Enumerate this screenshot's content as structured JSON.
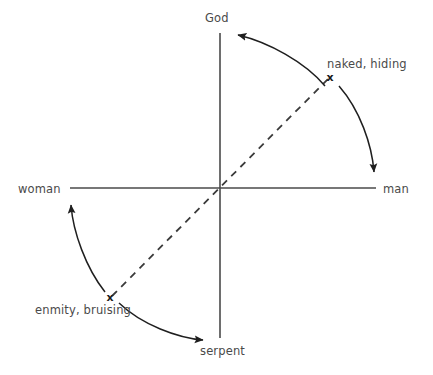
{
  "diagram": {
    "type": "relationship-axes-diagram",
    "axes": {
      "vertical": {
        "top_label": "God",
        "bottom_label": "serpent",
        "origin": {
          "x": 220,
          "y": 188
        },
        "top_y": 33,
        "bottom_y": 338
      },
      "horizontal": {
        "left_label": "woman",
        "right_label": "man",
        "left_x": 70,
        "right_x": 376
      }
    },
    "markers": [
      {
        "id": "marker-upper-right",
        "glyph": "x",
        "label": "naked, hiding",
        "x": 330,
        "y": 77,
        "quadrant": "upper-right"
      },
      {
        "id": "marker-lower-left",
        "glyph": "x",
        "label": "enmity, bruising",
        "x": 110,
        "y": 298,
        "quadrant": "lower-left"
      }
    ],
    "dashed_line": {
      "from": {
        "x": 110,
        "y": 298
      },
      "to": {
        "x": 330,
        "y": 77
      },
      "style": "dashed",
      "passes_through_origin": true
    },
    "arrows": [
      {
        "id": "arrow-to-god",
        "from_marker": "marker-upper-right",
        "to_axis_label": "God",
        "direction": "counter-clockwise"
      },
      {
        "id": "arrow-to-man",
        "from_marker": "marker-upper-right",
        "to_axis_label": "man",
        "direction": "clockwise"
      },
      {
        "id": "arrow-to-woman",
        "from_marker": "marker-lower-left",
        "to_axis_label": "woman",
        "direction": "counter-clockwise"
      },
      {
        "id": "arrow-to-serpent",
        "from_marker": "marker-lower-left",
        "to_axis_label": "serpent",
        "direction": "clockwise"
      }
    ],
    "colors": {
      "axis": "#4a4a4a",
      "arrow": "#1f1f1f",
      "dashed": "#3a3a3a",
      "text": "#4a4a4a",
      "background": "#ffffff"
    }
  }
}
